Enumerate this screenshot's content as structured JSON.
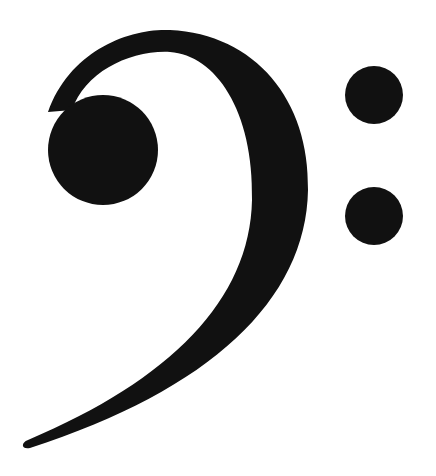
{
  "image": {
    "subject": "bass-clef",
    "description": "Black F (bass) clef music symbol on white background",
    "colors": {
      "ink": "#111111",
      "background": "#ffffff"
    }
  }
}
